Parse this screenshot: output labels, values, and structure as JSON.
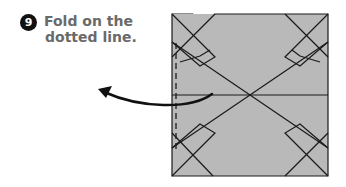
{
  "step": {
    "number": "9",
    "instruction_lines": [
      "Fold on the",
      "dotted line."
    ]
  },
  "diagram": {
    "paper_fill": "#b9b9b9",
    "line_color": "#1a1a1a",
    "fold_line": "dotted (valley fold) along left edge",
    "arrow": "curved arrow pointing left indicating fold direction"
  }
}
